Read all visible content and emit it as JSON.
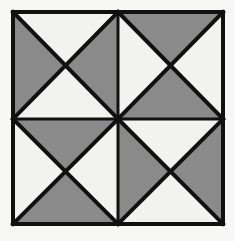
{
  "figure": {
    "name": "quilt-block-pinwheel-diagram",
    "canvas": {
      "width": 235,
      "height": 241
    },
    "colors": {
      "background": "#f7f7f5",
      "line": "#111111",
      "fill_gray": "#8a8a8a",
      "fill_white": "#f2f2f0"
    },
    "geometry": {
      "outer_left": 13,
      "outer_top": 12,
      "outer_right": 223,
      "outer_bottom": 224,
      "center_x": 118,
      "center_y": 119,
      "outer_border_width": 4,
      "divider_width": 3,
      "diagonal_width": 4
    },
    "grid": {
      "rows": 2,
      "cols": 2,
      "cells": [
        {
          "name": "cell-top-left",
          "row": 0,
          "col": 0,
          "triangles": {
            "top": "white",
            "right": "gray",
            "bottom": "white",
            "left": "gray"
          }
        },
        {
          "name": "cell-top-right",
          "row": 0,
          "col": 1,
          "triangles": {
            "top": "gray",
            "right": "white",
            "bottom": "gray",
            "left": "white"
          }
        },
        {
          "name": "cell-bottom-left",
          "row": 1,
          "col": 0,
          "triangles": {
            "top": "gray",
            "right": "white",
            "bottom": "gray",
            "left": "white"
          }
        },
        {
          "name": "cell-bottom-right",
          "row": 1,
          "col": 1,
          "triangles": {
            "top": "white",
            "right": "gray",
            "bottom": "white",
            "left": "gray"
          }
        }
      ]
    }
  }
}
